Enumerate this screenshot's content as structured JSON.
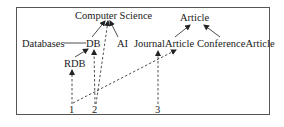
{
  "diagram": {
    "type": "concept-hierarchy-with-annotations",
    "left_hierarchy": {
      "nodes": {
        "computer_science": "Computer Science",
        "databases": "Databases",
        "db": "DB",
        "ai": "AI",
        "rdb": "RDB"
      },
      "edges": [
        {
          "from": "DB",
          "to": "Computer Science",
          "style": "solid-arrow"
        },
        {
          "from": "AI",
          "to": "Computer Science",
          "style": "solid-arrow"
        },
        {
          "from": "Databases",
          "to": "DB",
          "style": "solid-line (equivalence)"
        },
        {
          "from": "RDB",
          "to": "DB",
          "style": "solid-arrow"
        }
      ]
    },
    "right_hierarchy": {
      "nodes": {
        "article": "Article",
        "journal_article": "JournalArticle",
        "conference_article": "ConferenceArticle"
      },
      "edges": [
        {
          "from": "JournalArticle",
          "to": "Article",
          "style": "solid-arrow"
        },
        {
          "from": "ConferenceArticle",
          "to": "Article",
          "style": "solid-arrow"
        }
      ]
    },
    "instances": {
      "i1": "1",
      "i2": "2",
      "i3": "3"
    },
    "instance_links": [
      {
        "from": "1",
        "to": "RDB",
        "style": "dashed-arrow"
      },
      {
        "from": "1",
        "to": "JournalArticle",
        "style": "dashed-arrow"
      },
      {
        "from": "2",
        "to": "DB",
        "style": "dashed-arrow"
      },
      {
        "from": "2",
        "to": "Computer Science",
        "style": "dashed-arrow"
      },
      {
        "from": "3",
        "to": "JournalArticle",
        "style": "dashed-arrow"
      }
    ],
    "colors": {
      "text": "#1a1a1a",
      "lines": "#222222",
      "frame": "#555555",
      "background": "#ffffff"
    }
  }
}
